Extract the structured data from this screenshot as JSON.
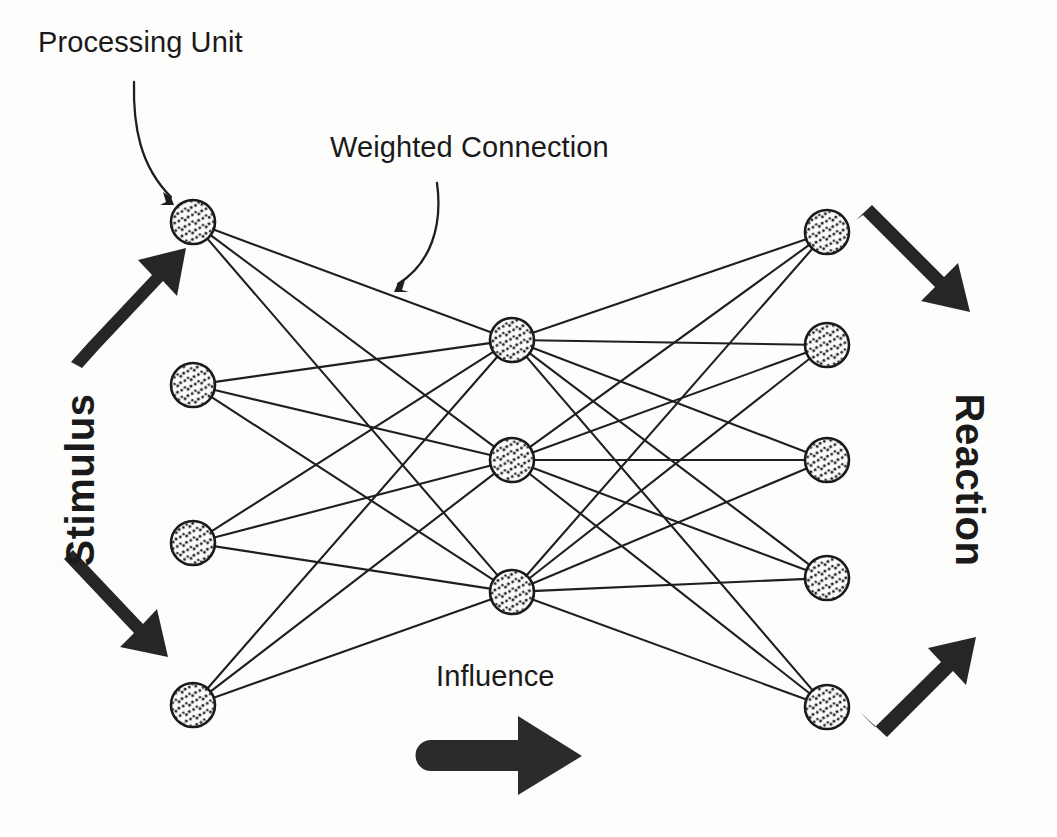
{
  "diagram": {
    "background_color": "#fdfdfc",
    "ink_color": "#1a1a1a",
    "labels": {
      "processing_unit": "Processing Unit",
      "weighted_connection": "Weighted Connection",
      "influence": "Influence",
      "stimulus": "Stimulus",
      "reaction": "Reaction"
    },
    "layers": [
      {
        "name": "input-layer",
        "role": "Stimulus input",
        "node_count": 4,
        "nodes": [
          {
            "id": "in-1",
            "cx": 193,
            "cy": 222,
            "r": 22
          },
          {
            "id": "in-2",
            "cx": 193,
            "cy": 385,
            "r": 22
          },
          {
            "id": "in-3",
            "cx": 193,
            "cy": 543,
            "r": 22
          },
          {
            "id": "in-4",
            "cx": 193,
            "cy": 705,
            "r": 22
          }
        ]
      },
      {
        "name": "hidden-layer",
        "role": "Processing units",
        "node_count": 3,
        "nodes": [
          {
            "id": "hid-1",
            "cx": 512,
            "cy": 340,
            "r": 22
          },
          {
            "id": "hid-2",
            "cx": 512,
            "cy": 460,
            "r": 22
          },
          {
            "id": "hid-3",
            "cx": 512,
            "cy": 592,
            "r": 22
          }
        ]
      },
      {
        "name": "output-layer",
        "role": "Reaction output",
        "node_count": 5,
        "nodes": [
          {
            "id": "out-1",
            "cx": 827,
            "cy": 232,
            "r": 22
          },
          {
            "id": "out-2",
            "cx": 827,
            "cy": 345,
            "r": 22
          },
          {
            "id": "out-3",
            "cx": 827,
            "cy": 460,
            "r": 22
          },
          {
            "id": "out-4",
            "cx": 827,
            "cy": 578,
            "r": 22
          },
          {
            "id": "out-5",
            "cx": 827,
            "cy": 707,
            "r": 22
          }
        ]
      }
    ],
    "connectivity": {
      "input_to_hidden": "fully-connected",
      "hidden_to_output": "fully-connected",
      "edge_count_input_hidden": 12,
      "edge_count_hidden_output": 15,
      "total_edges": 27
    },
    "arrows": [
      {
        "id": "stimulus-arrow-top",
        "from": [
          75,
          352
        ],
        "to": [
          176,
          248
        ],
        "style": "thick-block",
        "direction": "up-right"
      },
      {
        "id": "stimulus-arrow-bottom",
        "from": [
          62,
          576
        ],
        "to": [
          172,
          688
        ],
        "style": "thick-block",
        "direction": "down-right"
      },
      {
        "id": "reaction-arrow-top",
        "from": [
          862,
          228
        ],
        "to": [
          972,
          336
        ],
        "style": "thick-block",
        "direction": "down-right"
      },
      {
        "id": "reaction-arrow-bottom",
        "from": [
          866,
          702
        ],
        "to": [
          972,
          594
        ],
        "style": "thick-block",
        "direction": "up-right"
      },
      {
        "id": "influence-arrow",
        "from": [
          420,
          755
        ],
        "to": [
          575,
          755
        ],
        "style": "thick-block-round-tail",
        "direction": "right"
      },
      {
        "id": "processing-unit-pointer",
        "from": [
          134,
          82
        ],
        "to": [
          174,
          201
        ],
        "style": "thin-curved",
        "direction": "down-right"
      },
      {
        "id": "weighted-connection-pointer",
        "from": [
          437,
          183
        ],
        "to": [
          396,
          285
        ],
        "style": "thin-curved",
        "direction": "down-left"
      }
    ]
  }
}
